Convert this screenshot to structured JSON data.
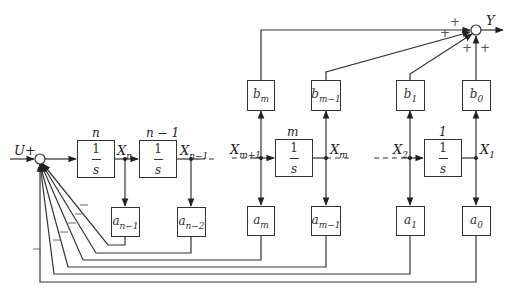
{
  "diagram": {
    "type": "block-diagram",
    "input": {
      "label": "U",
      "sign": "+"
    },
    "output": {
      "label": "Y"
    },
    "integrators": [
      {
        "id": "n",
        "index_label": "n",
        "num": "1",
        "den": "s",
        "out": "X",
        "out_sub": "n"
      },
      {
        "id": "n-1",
        "index_label": "n − 1",
        "num": "1",
        "den": "s",
        "out": "X",
        "out_sub": "n−1"
      },
      {
        "id": "m",
        "index_label": "m",
        "num": "1",
        "den": "s",
        "in": "X",
        "in_sub": "m+1",
        "out": "X",
        "out_sub": "m"
      },
      {
        "id": "1",
        "index_label": "1",
        "num": "1",
        "den": "s",
        "in": "X",
        "in_sub": "2",
        "out": "X",
        "out_sub": "1"
      }
    ],
    "feedback_gains": [
      {
        "base": "a",
        "sub": "n−1"
      },
      {
        "base": "a",
        "sub": "n−2"
      },
      {
        "base": "a",
        "sub": "m"
      },
      {
        "base": "a",
        "sub": "m−1"
      },
      {
        "base": "a",
        "sub": "1"
      },
      {
        "base": "a",
        "sub": "0"
      }
    ],
    "feedforward_gains": [
      {
        "base": "b",
        "sub": "m"
      },
      {
        "base": "b",
        "sub": "m−1"
      },
      {
        "base": "b",
        "sub": "1"
      },
      {
        "base": "b",
        "sub": "0"
      }
    ],
    "signs": {
      "plus": "+",
      "minus": "−"
    }
  }
}
